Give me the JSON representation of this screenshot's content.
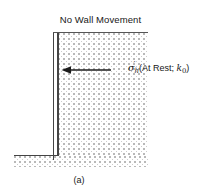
{
  "figure": {
    "title": "No Wall Movement",
    "caption": "(a)",
    "stress_label": {
      "symbol": "σ",
      "prime": "′",
      "subscript": "h",
      "condition_text": "(At Rest; ",
      "coefficient_symbol": "k",
      "coefficient_subscript": "0",
      "condition_close": ")",
      "full_text": "σ′h (At Rest; k0)"
    },
    "elements": {
      "wall_name": "retaining-wall",
      "soil_backfill_name": "soil-backfill",
      "soil_foundation_name": "soil-foundation",
      "arrow_direction": "left",
      "arrow_meaning": "horizontal earth pressure on wall"
    },
    "colors": {
      "line": "#444444",
      "stipple": "#b9b9b9",
      "text": "#171717",
      "background": "#ffffff"
    }
  }
}
